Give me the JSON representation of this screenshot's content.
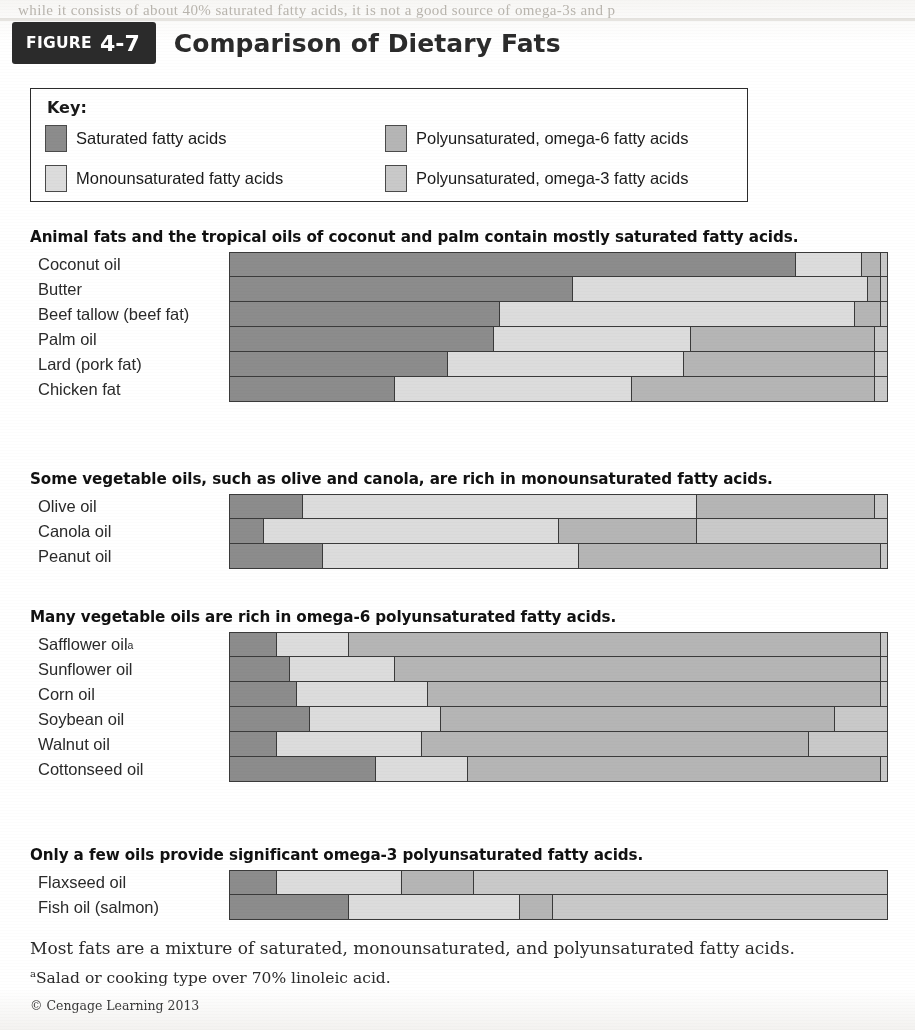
{
  "page": {
    "ghost_text": "while it consists of about 40% saturated fatty acids, it is not a good source of omega-3s and p"
  },
  "figure": {
    "tag_word": "FIGURE",
    "tag_number": "4-7",
    "title": "Comparison of Dietary Fats"
  },
  "key": {
    "title": "Key:",
    "items": [
      {
        "label": "Saturated fatty acids",
        "color": "#8c8c8c"
      },
      {
        "label": "Polyunsaturated, omega-6 fatty acids",
        "color": "#b5b5b5"
      },
      {
        "label": "Monounsaturated fatty acids",
        "color": "#dcdcdc"
      },
      {
        "label": "Polyunsaturated, omega-3 fatty acids",
        "color": "#c9c9c9"
      }
    ]
  },
  "colors": {
    "saturated": "#8c8c8c",
    "monounsaturated": "#dcdcdc",
    "omega6": "#b5b5b5",
    "omega3": "#c9c9c9",
    "outline": "#3a3a3a"
  },
  "footer": {
    "summary": "Most fats are a mixture of saturated, monounsaturated, and polyunsaturated fatty acids.",
    "footnote_marker": "a",
    "footnote": "Salad or cooking type over 70% linoleic acid.",
    "credit": "© Cengage Learning 2013"
  },
  "chart_data": {
    "type": "bar",
    "subtype": "stacked-horizontal-100pct",
    "title": "Comparison of Dietary Fats",
    "xlabel": "",
    "ylabel": "",
    "xlim": [
      0,
      100
    ],
    "grid": false,
    "legend_position": "top",
    "series": [
      {
        "name": "Saturated fatty acids",
        "color": "#8c8c8c"
      },
      {
        "name": "Monounsaturated fatty acids",
        "color": "#dcdcdc"
      },
      {
        "name": "Polyunsaturated, omega-6 fatty acids",
        "color": "#b5b5b5"
      },
      {
        "name": "Polyunsaturated, omega-3 fatty acids",
        "color": "#c9c9c9"
      }
    ],
    "sections": [
      {
        "heading": "Animal fats and the tropical oils of coconut and palm contain mostly saturated fatty acids.",
        "rows": [
          {
            "label": "Coconut oil",
            "values": [
              86,
              10,
              3,
              1
            ]
          },
          {
            "label": "Butter",
            "values": [
              52,
              45,
              2,
              1
            ]
          },
          {
            "label": "Beef tallow (beef fat)",
            "values": [
              41,
              54,
              4,
              1
            ]
          },
          {
            "label": "Palm oil",
            "values": [
              40,
              30,
              28,
              2
            ]
          },
          {
            "label": "Lard (pork fat)",
            "values": [
              33,
              36,
              29,
              2
            ]
          },
          {
            "label": "Chicken fat",
            "values": [
              25,
              36,
              37,
              2
            ]
          }
        ]
      },
      {
        "heading": "Some vegetable oils, such as olive and canola, are rich in monounsaturated fatty acids.",
        "rows": [
          {
            "label": "Olive oil",
            "values": [
              11,
              60,
              27,
              2
            ]
          },
          {
            "label": "Canola oil",
            "values": [
              5,
              45,
              21,
              29
            ]
          },
          {
            "label": "Peanut oil",
            "values": [
              14,
              39,
              46,
              1
            ]
          }
        ]
      },
      {
        "heading": "Many vegetable oils are rich in omega-6 polyunsaturated fatty acids.",
        "rows": [
          {
            "label": "Safflower oil",
            "footnote": "a",
            "values": [
              7,
              11,
              81,
              1
            ]
          },
          {
            "label": "Sunflower oil",
            "values": [
              9,
              16,
              74,
              1
            ]
          },
          {
            "label": "Corn oil",
            "values": [
              10,
              20,
              69,
              1
            ]
          },
          {
            "label": "Soybean oil",
            "values": [
              12,
              20,
              60,
              8
            ]
          },
          {
            "label": "Walnut oil",
            "values": [
              7,
              22,
              59,
              12
            ]
          },
          {
            "label": "Cottonseed oil",
            "values": [
              22,
              14,
              63,
              1
            ]
          }
        ]
      },
      {
        "heading": "Only a few oils provide significant omega-3 polyunsaturated fatty acids.",
        "rows": [
          {
            "label": "Flaxseed oil",
            "values": [
              7,
              19,
              11,
              63
            ]
          },
          {
            "label": "Fish oil (salmon)",
            "values": [
              18,
              26,
              5,
              51
            ]
          }
        ]
      }
    ]
  }
}
